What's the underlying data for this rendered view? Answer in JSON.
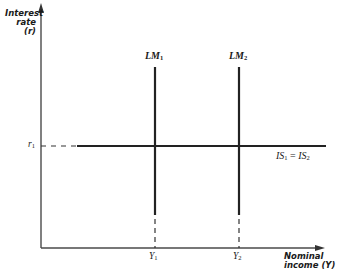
{
  "diagram": {
    "type": "IS-LM diagram with vertical LM curves",
    "y_axis": {
      "title_line1": "Interest",
      "title_line2": "rate (r)"
    },
    "x_axis": {
      "title_line1": "Nominal",
      "title_line2": "income (Y)"
    },
    "curves": [
      {
        "id": "lm1",
        "label_main": "LM",
        "label_sub": "1",
        "orientation": "vertical"
      },
      {
        "id": "lm2",
        "label_main": "LM",
        "label_sub": "2",
        "orientation": "vertical"
      },
      {
        "id": "is",
        "label_main": "IS",
        "label_sub": "1",
        "label_eq": " = ",
        "label_main2": "IS",
        "label_sub2": "2",
        "orientation": "horizontal"
      }
    ],
    "ticks": {
      "r1": {
        "main": "r",
        "sub": "1"
      },
      "y1": {
        "main": "Y",
        "sub": "1"
      },
      "y2": {
        "main": "Y",
        "sub": "2"
      }
    },
    "colors": {
      "ink": "#1a1a1a",
      "axis": "#4a4a4a",
      "background": "#ffffff"
    }
  }
}
